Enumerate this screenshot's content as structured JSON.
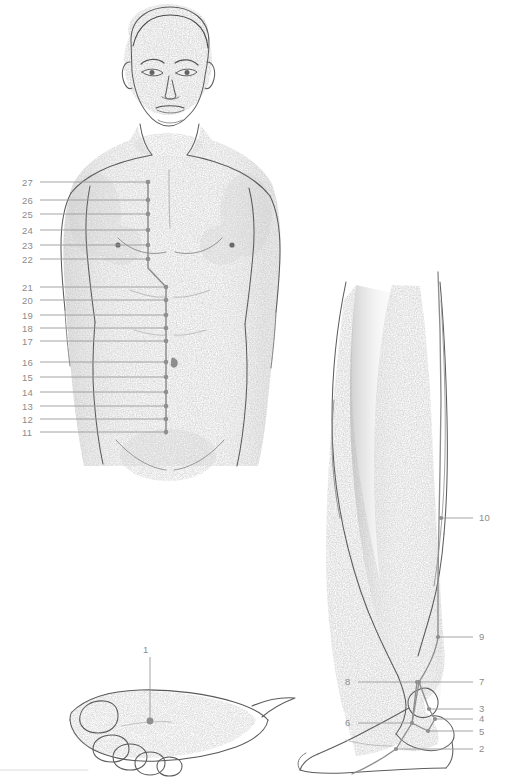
{
  "diagram": {
    "figure_kind": "anatomical-line-drawing",
    "background_color": "#ffffff",
    "label_color": "#8c8c8c",
    "leader_line_color": "#9a9a9a",
    "point_dot_color": "#8f8f8f",
    "body_outline_color": "#6f6f6f",
    "shading_color": "#b4b4b4",
    "views": [
      {
        "name": "anterior-torso",
        "description": "Front view of male torso and head with numbered points 11-27"
      },
      {
        "name": "sole-of-foot",
        "description": "Plantar view of left foot with point 1"
      },
      {
        "name": "medial-leg",
        "description": "Medial view of lower leg, ankle and foot with points 2-10"
      }
    ],
    "torso_points": [
      {
        "number": "27",
        "label_x": 22,
        "label_y": 178,
        "line_x1": 40,
        "line_x2": 148,
        "line_y": 182,
        "dot_x": 148,
        "dot_y": 182
      },
      {
        "number": "26",
        "label_x": 22,
        "label_y": 196,
        "line_x1": 40,
        "line_x2": 148,
        "line_y": 200,
        "dot_x": 148,
        "dot_y": 200
      },
      {
        "number": "25",
        "label_x": 22,
        "label_y": 210,
        "line_x1": 40,
        "line_x2": 148,
        "line_y": 214,
        "dot_x": 148,
        "dot_y": 214
      },
      {
        "number": "24",
        "label_x": 22,
        "label_y": 226,
        "line_x1": 40,
        "line_x2": 148,
        "line_y": 230,
        "dot_x": 148,
        "dot_y": 230
      },
      {
        "number": "23",
        "label_x": 22,
        "label_y": 241,
        "line_x1": 40,
        "line_x2": 148,
        "line_y": 245,
        "dot_x": 148,
        "dot_y": 245
      },
      {
        "number": "22",
        "label_x": 22,
        "label_y": 255,
        "line_x1": 40,
        "line_x2": 148,
        "line_y": 259,
        "dot_x": 148,
        "dot_y": 259
      },
      {
        "number": "21",
        "label_x": 22,
        "label_y": 283,
        "line_x1": 40,
        "line_x2": 166,
        "line_y": 287,
        "dot_x": 166,
        "dot_y": 287
      },
      {
        "number": "20",
        "label_x": 22,
        "label_y": 296,
        "line_x1": 40,
        "line_x2": 166,
        "line_y": 300,
        "dot_x": 166,
        "dot_y": 300
      },
      {
        "number": "19",
        "label_x": 22,
        "label_y": 311,
        "line_x1": 40,
        "line_x2": 166,
        "line_y": 315,
        "dot_x": 166,
        "dot_y": 315
      },
      {
        "number": "18",
        "label_x": 22,
        "label_y": 324,
        "line_x1": 40,
        "line_x2": 166,
        "line_y": 328,
        "dot_x": 166,
        "dot_y": 328
      },
      {
        "number": "17",
        "label_x": 22,
        "label_y": 337,
        "line_x1": 40,
        "line_x2": 166,
        "line_y": 341,
        "dot_x": 166,
        "dot_y": 341
      },
      {
        "number": "16",
        "label_x": 22,
        "label_y": 358,
        "line_x1": 40,
        "line_x2": 166,
        "line_y": 362,
        "dot_x": 166,
        "dot_y": 362
      },
      {
        "number": "15",
        "label_x": 22,
        "label_y": 373,
        "line_x1": 40,
        "line_x2": 166,
        "line_y": 377,
        "dot_x": 166,
        "dot_y": 377
      },
      {
        "number": "14",
        "label_x": 22,
        "label_y": 388,
        "line_x1": 40,
        "line_x2": 166,
        "line_y": 392,
        "dot_x": 166,
        "dot_y": 392
      },
      {
        "number": "13",
        "label_x": 22,
        "label_y": 402,
        "line_x1": 40,
        "line_x2": 166,
        "line_y": 406,
        "dot_x": 166,
        "dot_y": 406
      },
      {
        "number": "12",
        "label_x": 22,
        "label_y": 415,
        "line_x1": 40,
        "line_x2": 166,
        "line_y": 419,
        "dot_x": 166,
        "dot_y": 419
      },
      {
        "number": "11",
        "label_x": 22,
        "label_y": 428,
        "line_x1": 40,
        "line_x2": 166,
        "line_y": 432,
        "dot_x": 166,
        "dot_y": 432
      }
    ],
    "foot_sole_point": {
      "number": "1",
      "label_x": 143,
      "label_y": 645,
      "line_x": 150,
      "line_y1": 657,
      "line_y2": 718,
      "dot_x": 150,
      "dot_y": 721
    },
    "leg_points_right": [
      {
        "number": "10",
        "label_x": 479,
        "label_y": 513,
        "line_x1": 441,
        "line_x2": 473,
        "line_y": 518,
        "dot_x": 441,
        "dot_y": 518
      },
      {
        "number": "9",
        "label_x": 479,
        "label_y": 632,
        "line_x1": 438,
        "line_x2": 473,
        "line_y": 637,
        "dot_x": 438,
        "dot_y": 637
      },
      {
        "number": "7",
        "label_x": 479,
        "label_y": 677,
        "line_x1": 419,
        "line_x2": 473,
        "line_y": 682,
        "dot_x": 419,
        "dot_y": 682
      },
      {
        "number": "3",
        "label_x": 479,
        "label_y": 704,
        "line_x1": 429,
        "line_x2": 473,
        "line_y": 709,
        "dot_x": 429,
        "dot_y": 709
      },
      {
        "number": "4",
        "label_x": 479,
        "label_y": 714,
        "line_x1": 435,
        "line_x2": 473,
        "line_y": 719,
        "dot_x": 435,
        "dot_y": 719
      },
      {
        "number": "5",
        "label_x": 479,
        "label_y": 727,
        "line_x1": 428,
        "line_x2": 473,
        "line_y": 731,
        "dot_x": 428,
        "dot_y": 731
      },
      {
        "number": "2",
        "label_x": 479,
        "label_y": 744,
        "line_x1": 396,
        "line_x2": 473,
        "line_y": 749,
        "dot_x": 396,
        "dot_y": 749
      }
    ],
    "leg_points_left": [
      {
        "number": "8",
        "label_x": 345,
        "label_y": 677,
        "line_x1": 358,
        "line_x2": 417,
        "line_y": 682,
        "dot_x": 417,
        "dot_y": 682
      },
      {
        "number": "6",
        "label_x": 345,
        "label_y": 718,
        "line_x1": 358,
        "line_x2": 412,
        "line_y": 723,
        "dot_x": 412,
        "dot_y": 723
      }
    ]
  }
}
